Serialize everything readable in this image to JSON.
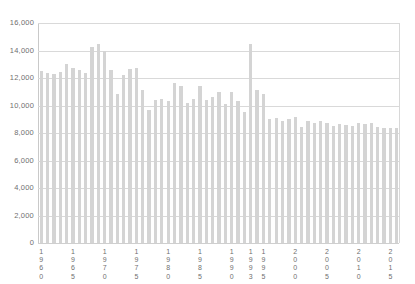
{
  "chart_data": {
    "type": "bar",
    "title": "",
    "subtitle": "",
    "xlabel": "",
    "ylabel": "",
    "ylim": [
      0,
      16000
    ],
    "ytick_step": 2000,
    "ytick_labels": [
      "16,000",
      "14,000",
      "12,000",
      "10,000",
      "8,000",
      "6,000",
      "4,000",
      "2,000",
      "0"
    ],
    "ytick_values": [
      16000,
      14000,
      12000,
      10000,
      8000,
      6000,
      4000,
      2000,
      0
    ],
    "grid": true,
    "grid_axis": "y",
    "legend": null,
    "legend_position": "none",
    "bar_color": "#d4d4d4",
    "grid_color": "#d9d9d9",
    "axis_color": "#c9c9c9",
    "label_color": "#6f6f6f",
    "xtick_labels": [
      "1960",
      "1965",
      "1970",
      "1975",
      "1980",
      "1985",
      "1990",
      "1993",
      "1995",
      "2000",
      "2005",
      "2010",
      "2015"
    ],
    "xtick_categories": [
      1960,
      1965,
      1970,
      1975,
      1980,
      1985,
      1990,
      1993,
      1995,
      2000,
      2005,
      2010,
      2015
    ],
    "categories": [
      1960,
      1961,
      1962,
      1963,
      1964,
      1965,
      1966,
      1967,
      1968,
      1969,
      1970,
      1971,
      1972,
      1973,
      1974,
      1975,
      1976,
      1977,
      1978,
      1979,
      1980,
      1981,
      1982,
      1983,
      1984,
      1985,
      1986,
      1987,
      1988,
      1989,
      1990,
      1991,
      1992,
      1993,
      1994,
      1995,
      1996,
      1997,
      1998,
      1999,
      2000,
      2001,
      2002,
      2003,
      2004,
      2005,
      2006,
      2007,
      2008,
      2009,
      2010,
      2011,
      2012,
      2013,
      2014,
      2015,
      2016
    ],
    "values": [
      12500,
      12400,
      12300,
      12450,
      13000,
      12700,
      12550,
      12400,
      14250,
      14450,
      14000,
      12600,
      10850,
      12200,
      12650,
      12700,
      11100,
      9700,
      10400,
      10450,
      10350,
      11650,
      11450,
      10200,
      10500,
      11400,
      10400,
      10600,
      10950,
      10100,
      11000,
      10300,
      9500,
      14450,
      11100,
      10850,
      9000,
      9100,
      8900,
      9050,
      9150,
      8450,
      8900,
      8750,
      8900,
      8700,
      8500,
      8650,
      8550,
      8500,
      8700,
      8650,
      8700,
      8450,
      8400,
      8400,
      8400
    ]
  }
}
